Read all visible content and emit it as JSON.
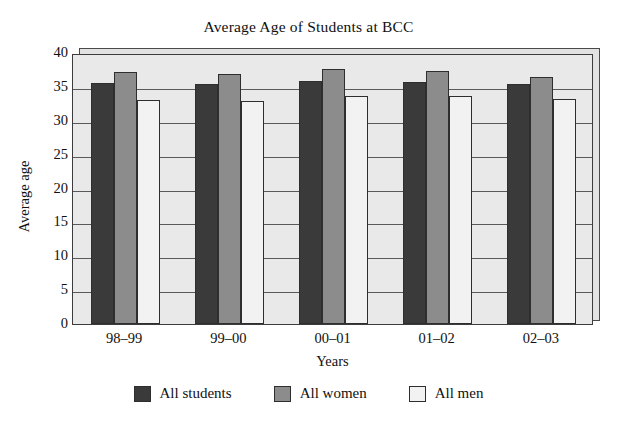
{
  "chart_data": {
    "type": "bar",
    "title": "Average Age of Students at BCC",
    "xlabel": "Years",
    "ylabel": "Average age",
    "categories": [
      "98–99",
      "99–00",
      "00–01",
      "01–02",
      "02–03"
    ],
    "series": [
      {
        "name": "All students",
        "color": "#3a3a3a",
        "values": [
          35.6,
          35.5,
          35.9,
          35.7,
          35.5
        ]
      },
      {
        "name": "All women",
        "color": "#8c8c8c",
        "values": [
          37.2,
          36.9,
          37.6,
          37.4,
          36.5
        ]
      },
      {
        "name": "All men",
        "color": "#f2f2f2",
        "values": [
          33.1,
          32.9,
          33.6,
          33.6,
          33.2
        ]
      }
    ],
    "ylim": [
      0,
      40
    ],
    "yticks": [
      0,
      5,
      10,
      15,
      20,
      25,
      30,
      35,
      40
    ],
    "ytick_labels": [
      "0",
      "5",
      "10",
      "15",
      "20",
      "25",
      "30",
      "35",
      "40"
    ],
    "grid": true,
    "grid_axis": "y",
    "legend_position": "bottom",
    "plot_background": "#e9e9e9",
    "frame_color": "#3c3c3c"
  }
}
